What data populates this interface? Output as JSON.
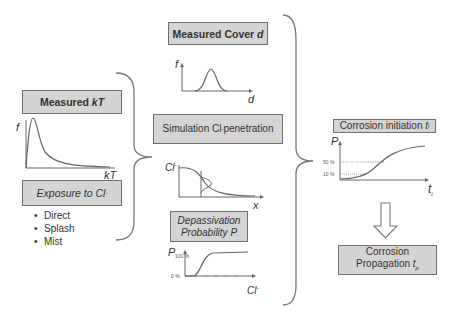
{
  "boxes": {
    "measured_kt": {
      "label": "Measured ",
      "var": "kT"
    },
    "exposure": {
      "label": "Exposure to Cl",
      "sup": "-"
    },
    "measured_cover": {
      "label": "Measured Cover ",
      "var": "d"
    },
    "simulation": {
      "label": "Simulation Cl",
      "sup": "-",
      "rest": " penetration"
    },
    "depassivation": {
      "line1": "Depassivation",
      "line2": "Probability P"
    },
    "initiation": {
      "label": "Corrosion initiation ",
      "var": "t",
      "sub": "i"
    },
    "propagation": {
      "line1": "Corrosion",
      "line2": "Propagation ",
      "var": "t",
      "sub": "p"
    }
  },
  "exposure_types": [
    "Direct",
    "Splash",
    "Mist"
  ],
  "plots": {
    "kt": {
      "ylabel": "f",
      "xlabel": "kT"
    },
    "cover": {
      "ylabel": "f",
      "xlabel": "d"
    },
    "chloride": {
      "ylabel": "Cl",
      "ylabel_sup": "-",
      "xlabel": "x"
    },
    "depass": {
      "ylabel": "P",
      "y_top": "100 %",
      "y_bottom": "0 %",
      "xlabel": "Cl",
      "xlabel_sup": "-"
    },
    "initiation": {
      "ylabel": "P",
      "tick_50": "50 %",
      "tick_10": "10 %",
      "xlabel": "t",
      "xlabel_sub": "i"
    }
  },
  "colors": {
    "box_fill": "#d4d4d4",
    "box_border": "#6f6f6f",
    "line": "#666666"
  }
}
